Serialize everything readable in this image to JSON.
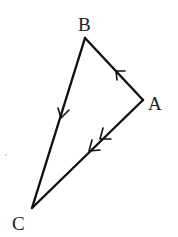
{
  "diagram": {
    "type": "vector-triangle",
    "stroke_color": "#111111",
    "label_color": "#222222",
    "vertices": [
      {
        "id": "A",
        "label": "A",
        "x": 143,
        "y": 100,
        "label_x": 148,
        "label_y": 110
      },
      {
        "id": "B",
        "label": "B",
        "x": 85,
        "y": 38,
        "label_x": 78,
        "label_y": 31
      },
      {
        "id": "C",
        "label": "C",
        "x": 32,
        "y": 208,
        "label_x": 12,
        "label_y": 230
      }
    ],
    "edges": [
      {
        "from": "A",
        "to": "B",
        "arrow_count": 1,
        "arrow_direction": "toward B"
      },
      {
        "from": "B",
        "to": "C",
        "arrow_count": 1,
        "arrow_direction": "toward C"
      },
      {
        "from": "A",
        "to": "C",
        "arrow_count": 2,
        "arrow_direction": "toward C"
      }
    ]
  }
}
